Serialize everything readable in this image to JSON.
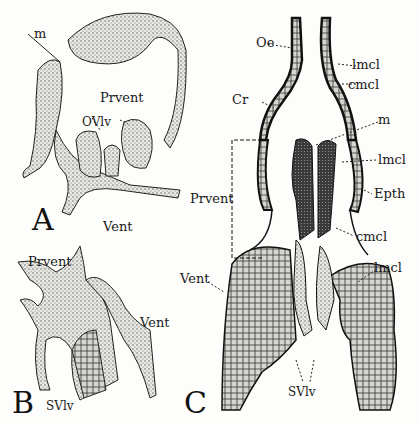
{
  "figure": {
    "panels": [
      {
        "id": "A",
        "label": "A"
      },
      {
        "id": "B",
        "label": "B"
      },
      {
        "id": "C",
        "label": "C"
      }
    ],
    "labels": {
      "a_m": "m",
      "a_prvent": "Prvent",
      "a_ovlv": "OVlv",
      "a_vent": "Vent",
      "b_prvent": "Prvent",
      "b_vent": "Vent",
      "b_svlv": "SVlv",
      "c_oe": "Oe",
      "c_lmcl_top": "lmcl",
      "c_cmcl_top": "cmcl",
      "c_cr": "Cr",
      "c_m": "m",
      "c_lmcl_mid": "lmcl",
      "c_epth": "Epth",
      "c_prvent": "Prvent",
      "c_cmcl_low": "cmcl",
      "c_vent": "Vent",
      "c_lmcl_low": "lmcl",
      "c_svlv": "SVlv"
    },
    "colors": {
      "ink": "#1a1a1a",
      "stipple": "#8a8a8a",
      "dark_tissue": "#2b2b2b",
      "background": "#fdfdfb"
    }
  }
}
